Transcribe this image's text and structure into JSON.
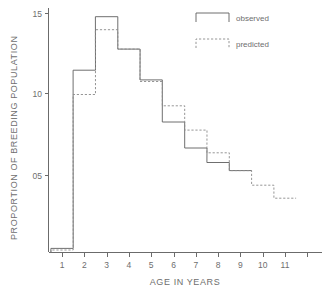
{
  "chart_data": {
    "type": "line",
    "title": "",
    "subtitle": "",
    "xlabel": "AGE IN YEARS",
    "ylabel": "PROPORTION OF BREEDING POPULATION",
    "x": [
      1,
      2,
      3,
      4,
      5,
      6,
      7,
      8,
      9,
      10,
      11
    ],
    "categories": [
      "1",
      "2",
      "3",
      "4",
      "5",
      "6",
      "7",
      "8",
      "9",
      "10",
      "11"
    ],
    "xtick_labels": [
      "1",
      "2",
      "3",
      "4",
      "5",
      "6",
      "7",
      "8",
      "9",
      "10",
      "11"
    ],
    "ytick_labels": [
      "05",
      "10",
      "15"
    ],
    "ytick_values": [
      0.05,
      0.1,
      0.15
    ],
    "xlim": [
      0.5,
      11.9
    ],
    "ylim": [
      0.0,
      0.155
    ],
    "grid": false,
    "step_style": "histogram-steps",
    "legend_position": "top-right",
    "series": [
      {
        "name": "observed",
        "line_style": "solid",
        "color": "#5f5f5f",
        "values": [
          0.005,
          0.115,
          0.148,
          0.128,
          0.109,
          0.083,
          0.067,
          0.058,
          0.053,
          null,
          null
        ]
      },
      {
        "name": "predicted",
        "line_style": "dashed",
        "color": "#8a8a8a",
        "values": [
          0.004,
          0.1,
          0.14,
          0.128,
          0.108,
          0.093,
          0.078,
          0.064,
          0.053,
          0.044,
          0.036
        ]
      }
    ],
    "annotations": []
  },
  "legend": {
    "entries": [
      {
        "label": "observed",
        "style": "solid"
      },
      {
        "label": "predicted",
        "style": "dashed"
      }
    ]
  },
  "axes": {
    "x_title": "AGE IN YEARS",
    "y_title": "PROPORTION OF BREEDING POPULATION"
  },
  "colors": {
    "observed": "#5f5f5f",
    "predicted": "#8a8a8a",
    "axis": "#6b6b6b",
    "text": "#6e6e6e",
    "background": "#ffffff"
  }
}
